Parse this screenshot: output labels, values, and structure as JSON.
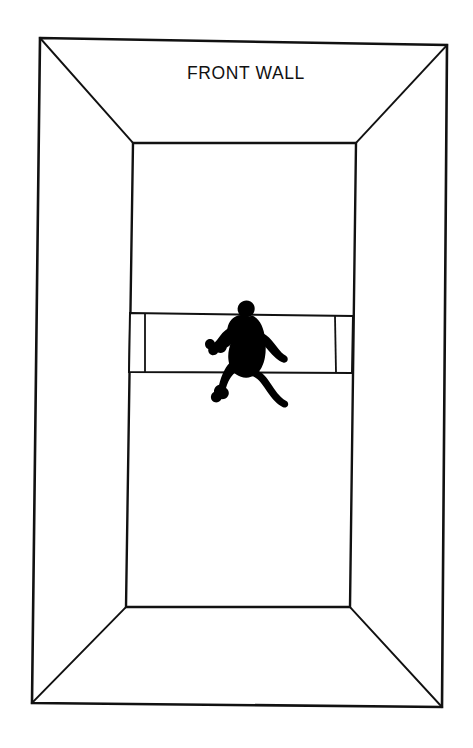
{
  "diagram": {
    "title_label": "FRONT WALL",
    "labels": {
      "front_wall": "FRONT WALL"
    },
    "colors": {
      "line": "#111111",
      "fill": "#ffffff",
      "figure": "#000000",
      "background": "#ffffff"
    },
    "line_widths": {
      "outer_frame": 2.6,
      "inner_wall": 2.4,
      "perspective_edge": 1.9,
      "band": 2.0,
      "band_divider": 1.8
    },
    "geometry": {
      "canvas": {
        "width": 473,
        "height": 748
      },
      "outer_frame": {
        "top_left": [
          40,
          38
        ],
        "top_right": [
          447,
          45
        ],
        "bottom_right": [
          442,
          707
        ],
        "bottom_left": [
          32,
          703
        ]
      },
      "inner_wall": {
        "top_left": [
          133,
          143
        ],
        "top_right": [
          356,
          143
        ],
        "bottom_right": [
          350,
          607
        ],
        "bottom_left": [
          126,
          607
        ]
      },
      "perspective_edges": [
        {
          "name": "top-left-diagonal",
          "from": [
            40,
            38
          ],
          "to": [
            133,
            143
          ]
        },
        {
          "name": "top-right-diagonal",
          "from": [
            447,
            45
          ],
          "to": [
            356,
            143
          ]
        },
        {
          "name": "bottom-right-diagonal",
          "from": [
            442,
            707
          ],
          "to": [
            350,
            607
          ]
        },
        {
          "name": "bottom-left-diagonal",
          "from": [
            32,
            703
          ],
          "to": [
            126,
            607
          ]
        }
      ],
      "service_band": {
        "top_left": [
          130,
          313
        ],
        "top_right": [
          353,
          316
        ],
        "bottom_right": [
          352,
          373
        ],
        "bottom_left": [
          129,
          372
        ],
        "divider_left_x_top": 145,
        "divider_left_x_bottom": 145,
        "divider_right_x_top": 335,
        "divider_right_x_bottom": 336
      },
      "player": {
        "bbox": [
          214,
          300,
          76,
          103
        ],
        "description": "black-silhouette-running-player"
      }
    },
    "text_position": {
      "x": 246,
      "y": 79
    }
  }
}
